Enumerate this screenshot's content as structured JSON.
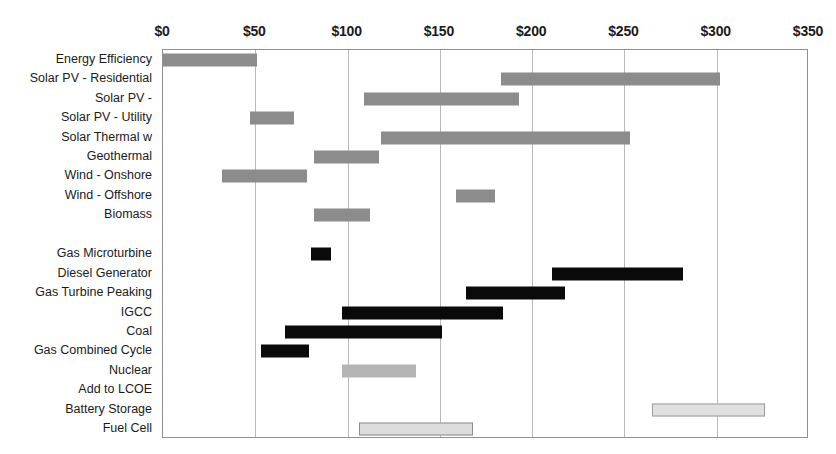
{
  "chart_data": {
    "type": "bar",
    "orientation": "horizontal",
    "subtype": "range-bar",
    "title": "",
    "subtitle": "",
    "xlabel": "",
    "ylabel": "",
    "xlim": [
      0,
      350
    ],
    "xticks": [
      0,
      50,
      100,
      150,
      200,
      250,
      300,
      350
    ],
    "xtick_labels": [
      "$0",
      "$50",
      "$100",
      "$150",
      "$200",
      "$250",
      "$300",
      "$350"
    ],
    "grid": "vertical",
    "legend": "none",
    "axis_position": "top",
    "categories": [
      "Energy Efficiency",
      "Solar PV - Residential",
      "Solar PV - ",
      "Solar PV - Utility",
      "Solar Thermal w",
      "Geothermal",
      "Wind - Onshore",
      "Wind - Offshore",
      "Biomass",
      "",
      "Gas Microturbine",
      "Diesel Generator",
      "Gas Turbine Peaking",
      "IGCC",
      "Coal",
      "Gas Combined Cycle",
      "Nuclear",
      "Add to LCOE",
      "Battery Storage",
      "Fuel Cell"
    ],
    "bars": [
      {
        "category": "Energy Efficiency",
        "row": 0,
        "low": 0,
        "high": 51,
        "style": "gray"
      },
      {
        "category": "Solar PV - Residential",
        "row": 1,
        "low": 183,
        "high": 302,
        "style": "gray"
      },
      {
        "category": "Solar PV - ",
        "row": 2,
        "low": 109,
        "high": 193,
        "style": "gray"
      },
      {
        "category": "Solar PV - Utility",
        "row": 3,
        "low": 47,
        "high": 71,
        "style": "gray"
      },
      {
        "category": "Solar Thermal w",
        "row": 4,
        "low": 118,
        "high": 253,
        "style": "gray"
      },
      {
        "category": "Geothermal",
        "row": 5,
        "low": 82,
        "high": 117,
        "style": "gray"
      },
      {
        "category": "Wind - Onshore",
        "row": 6,
        "low": 32,
        "high": 78,
        "style": "gray"
      },
      {
        "category": "Wind - Offshore",
        "row": 7,
        "low": 159,
        "high": 180,
        "style": "gray"
      },
      {
        "category": "Biomass",
        "row": 8,
        "low": 82,
        "high": 112,
        "style": "gray"
      },
      {
        "category": "Gas Microturbine",
        "row": 10,
        "low": 80,
        "high": 91,
        "style": "black"
      },
      {
        "category": "Diesel Generator",
        "row": 11,
        "low": 211,
        "high": 282,
        "style": "black"
      },
      {
        "category": "Gas Turbine Peaking",
        "row": 12,
        "low": 164,
        "high": 218,
        "style": "black"
      },
      {
        "category": "IGCC",
        "row": 13,
        "low": 97,
        "high": 184,
        "style": "black"
      },
      {
        "category": "Coal",
        "row": 14,
        "low": 66,
        "high": 151,
        "style": "black"
      },
      {
        "category": "Gas Combined Cycle",
        "row": 15,
        "low": 53,
        "high": 79,
        "style": "black"
      },
      {
        "category": "Nuclear",
        "row": 16,
        "low": 97,
        "high": 137,
        "style": "lightgray"
      },
      {
        "category": "Battery Storage",
        "row": 18,
        "low": 265,
        "high": 326,
        "style": "palegray"
      },
      {
        "category": "Fuel Cell",
        "row": 19,
        "low": 106,
        "high": 168,
        "style": "palegray2"
      }
    ]
  },
  "colors": {
    "renewable_bar": "#8c8c8c",
    "conventional_bar": "#0a0a0a",
    "nuclear_bar": "#b4b4b4",
    "storage_bar": "#e0e0e0",
    "gridline": "#b8b8b8",
    "frame": "#8f8f8f",
    "text": "#1a1a1a",
    "background": "#ffffff"
  }
}
